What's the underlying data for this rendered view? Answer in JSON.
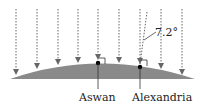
{
  "diagram": {
    "angle_label": "7.2°",
    "cities": [
      {
        "name": "Aswan"
      },
      {
        "name": "Alexandria"
      }
    ],
    "colors": {
      "ground": "#8a8a8a",
      "ray": "#666666",
      "dot": "#000000"
    },
    "rays_count": 9
  }
}
